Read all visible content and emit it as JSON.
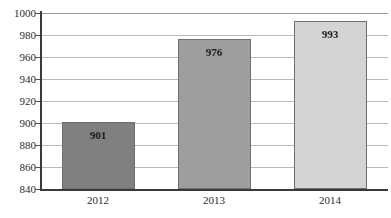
{
  "chart_data": {
    "type": "bar",
    "title": "",
    "subtitle": "",
    "xlabel": "",
    "ylabel": "",
    "categories": [
      "2012",
      "2013",
      "2014"
    ],
    "values": [
      901,
      976,
      993
    ],
    "data_labels": [
      "901",
      "976",
      "993"
    ],
    "ylim": [
      840,
      1000
    ],
    "ytick_step": 20,
    "yticks": [
      1000,
      980,
      960,
      940,
      920,
      900,
      880,
      860,
      840
    ],
    "ytick_labels": [
      "1000",
      "980",
      "960",
      "940",
      "920",
      "900",
      "880",
      "860",
      "840"
    ],
    "grid": true,
    "grid_axis": "y",
    "legend": false,
    "legend_position": "none",
    "bar_colors": [
      "#808080",
      "#9e9e9e",
      "#d4d4d4"
    ],
    "bar_border_color": "#6f6f6f",
    "axis_color": "#3a3a3a",
    "gridline_color": "#b9b9b9",
    "label_text_color": "#1d1d1d",
    "tick_text_color": "#2b2b2b",
    "background_color": "#ffffff"
  }
}
